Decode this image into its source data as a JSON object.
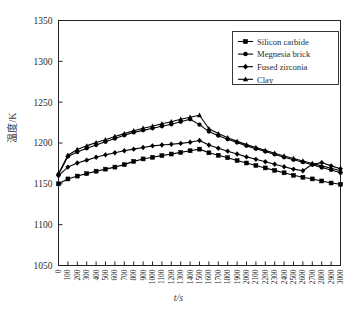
{
  "chart_data": {
    "type": "line",
    "title": "",
    "xlabel": "t/s",
    "ylabel": "温度/K",
    "xlim": [
      0,
      3000
    ],
    "ylim": [
      1050,
      1350
    ],
    "yticks": [
      1050,
      1100,
      1150,
      1200,
      1250,
      1300,
      1350
    ],
    "xticks": [
      0,
      100,
      200,
      300,
      400,
      500,
      600,
      700,
      800,
      900,
      1000,
      1100,
      1200,
      1300,
      1400,
      1500,
      1600,
      1700,
      1800,
      1900,
      2000,
      2100,
      2200,
      2300,
      2400,
      2500,
      2600,
      2700,
      2800,
      2900,
      3000
    ],
    "grid": false,
    "legend_position": "upper right",
    "x": [
      0,
      100,
      200,
      300,
      400,
      500,
      600,
      700,
      800,
      900,
      1000,
      1100,
      1200,
      1300,
      1400,
      1500,
      1600,
      1700,
      1800,
      1900,
      2000,
      2100,
      2200,
      2300,
      2400,
      2500,
      2600,
      2700,
      2800,
      2900,
      3000
    ],
    "series": [
      {
        "name": "Silicon carbide",
        "marker": "square",
        "color": "#000000",
        "values": [
          1150.0,
          1156.0,
          1159.5,
          1162.5,
          1165.5,
          1168.0,
          1170.5,
          1173.5,
          1177.5,
          1180.5,
          1182.5,
          1184.5,
          1186.5,
          1188.5,
          1190.5,
          1192.5,
          1188.0,
          1185.0,
          1182.0,
          1178.5,
          1175.5,
          1172.5,
          1169.5,
          1166.5,
          1163.5,
          1160.5,
          1158.0,
          1156.0,
          1153.5,
          1151.0,
          1149.5
        ]
      },
      {
        "name": "Megnesia brick",
        "marker": "circle",
        "color": "#000000",
        "values": [
          1161.5,
          1183.5,
          1189.0,
          1193.5,
          1197.5,
          1201.5,
          1205.5,
          1209.5,
          1213.0,
          1215.5,
          1218.0,
          1220.5,
          1223.0,
          1226.0,
          1229.0,
          1222.5,
          1214.0,
          1209.0,
          1204.5,
          1200.5,
          1196.5,
          1193.0,
          1189.5,
          1186.0,
          1182.5,
          1179.5,
          1176.5,
          1173.5,
          1170.0,
          1167.0,
          1163.5
        ]
      },
      {
        "name": "Fused zirconia",
        "marker": "diamond",
        "color": "#000000",
        "values": [
          1160.0,
          1170.5,
          1175.5,
          1179.0,
          1182.5,
          1185.5,
          1188.0,
          1190.5,
          1192.5,
          1194.5,
          1196.5,
          1197.5,
          1198.5,
          1199.5,
          1201.0,
          1203.0,
          1197.5,
          1193.5,
          1190.0,
          1186.5,
          1183.0,
          1180.0,
          1177.0,
          1174.0,
          1171.0,
          1168.0,
          1166.0,
          1174.0,
          1176.0,
          1172.0,
          1168.5
        ]
      },
      {
        "name": "Clay",
        "marker": "triangle",
        "color": "#000000",
        "values": [
          1162.5,
          1185.0,
          1192.0,
          1196.5,
          1200.5,
          1204.0,
          1208.0,
          1211.5,
          1215.0,
          1218.0,
          1220.5,
          1223.5,
          1226.0,
          1229.0,
          1231.5,
          1234.0,
          1217.5,
          1211.5,
          1206.5,
          1202.0,
          1198.0,
          1194.5,
          1191.0,
          1187.5,
          1184.0,
          1181.0,
          1178.0,
          1175.0,
          1172.0,
          1169.0,
          1166.0
        ]
      }
    ]
  },
  "legend": {
    "items": [
      {
        "label": "Silicon carbide"
      },
      {
        "label": "Megnesia brick"
      },
      {
        "label": "Fused zirconia"
      },
      {
        "label": "Clay"
      }
    ]
  },
  "axes": {
    "y_title": "温度/K",
    "x_title": "t/s"
  }
}
